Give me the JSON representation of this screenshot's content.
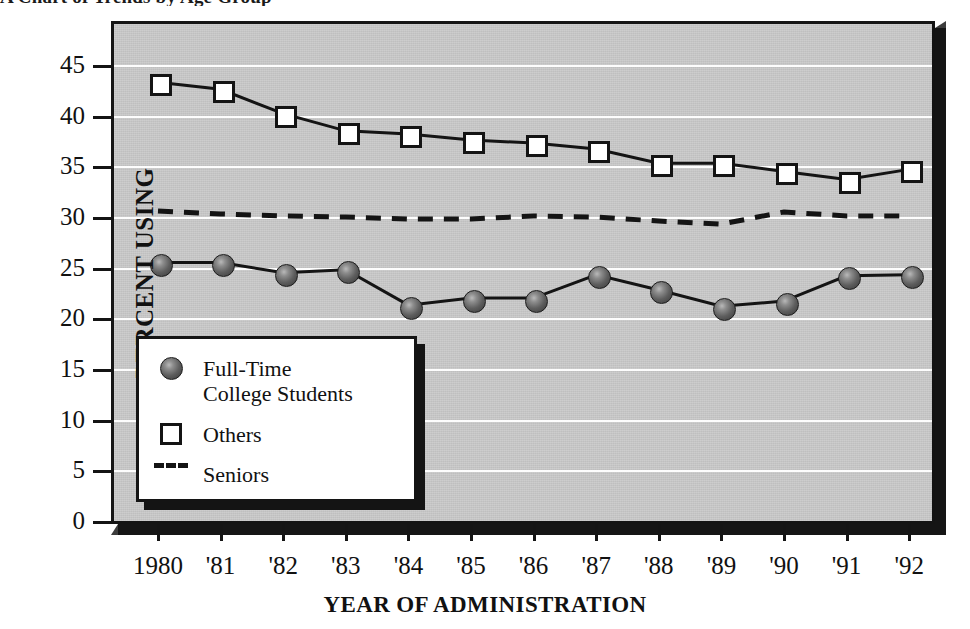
{
  "title_fragment": "A Chart of Trends by Age Group",
  "axes": {
    "y_title": "PERCENT USING",
    "x_title": "YEAR OF ADMINISTRATION",
    "y_ticks": [
      0,
      5,
      10,
      15,
      20,
      25,
      30,
      35,
      40,
      45
    ],
    "y_gridlines": [
      5,
      10,
      15,
      20,
      25,
      30,
      35,
      40,
      45
    ]
  },
  "legend": {
    "items": [
      {
        "label": "Full-Time\nCollege Students",
        "marker": "filled-circle-icon"
      },
      {
        "label": "Others",
        "marker": "open-square-icon"
      },
      {
        "label": "Seniors",
        "marker": "dashed-line-icon"
      }
    ]
  },
  "colors": {
    "plot_background": "#c9c9c9",
    "gridline": "#fdfdfd",
    "ink": "#141414",
    "circle_marker": "#5a5a5a",
    "square_marker": "#ffffff",
    "frame_shadow": "#151515"
  },
  "chart_data": {
    "type": "line",
    "title": "A Chart of Trends by Age Group",
    "xlabel": "YEAR OF ADMINISTRATION",
    "ylabel": "PERCENT USING",
    "ylim": [
      0,
      45
    ],
    "grid": true,
    "legend_position": "lower-left-inside",
    "categories": [
      "1980",
      "'81",
      "'82",
      "'83",
      "'84",
      "'85",
      "'86",
      "'87",
      "'88",
      "'89",
      "'90",
      "'91",
      "'92"
    ],
    "x": [
      1980,
      1981,
      1982,
      1983,
      1984,
      1985,
      1986,
      1987,
      1988,
      1989,
      1990,
      1991,
      1992
    ],
    "series": [
      {
        "name": "Full-Time College Students",
        "marker": "filled-circle",
        "linestyle": "solid",
        "values": [
          25.5,
          25.5,
          24.5,
          24.8,
          21.3,
          22.0,
          22.0,
          24.3,
          22.8,
          21.2,
          21.7,
          24.2,
          24.3
        ]
      },
      {
        "name": "Others",
        "marker": "open-square",
        "linestyle": "solid",
        "values": [
          43.3,
          42.6,
          40.2,
          38.5,
          38.2,
          37.6,
          37.3,
          36.7,
          35.3,
          35.3,
          34.5,
          33.7,
          34.7
        ]
      },
      {
        "name": "Seniors",
        "marker": "none",
        "linestyle": "dashed",
        "values": [
          30.6,
          30.3,
          30.1,
          30.0,
          29.8,
          29.8,
          30.1,
          30.0,
          29.6,
          29.3,
          30.5,
          30.1,
          30.1
        ]
      }
    ]
  }
}
